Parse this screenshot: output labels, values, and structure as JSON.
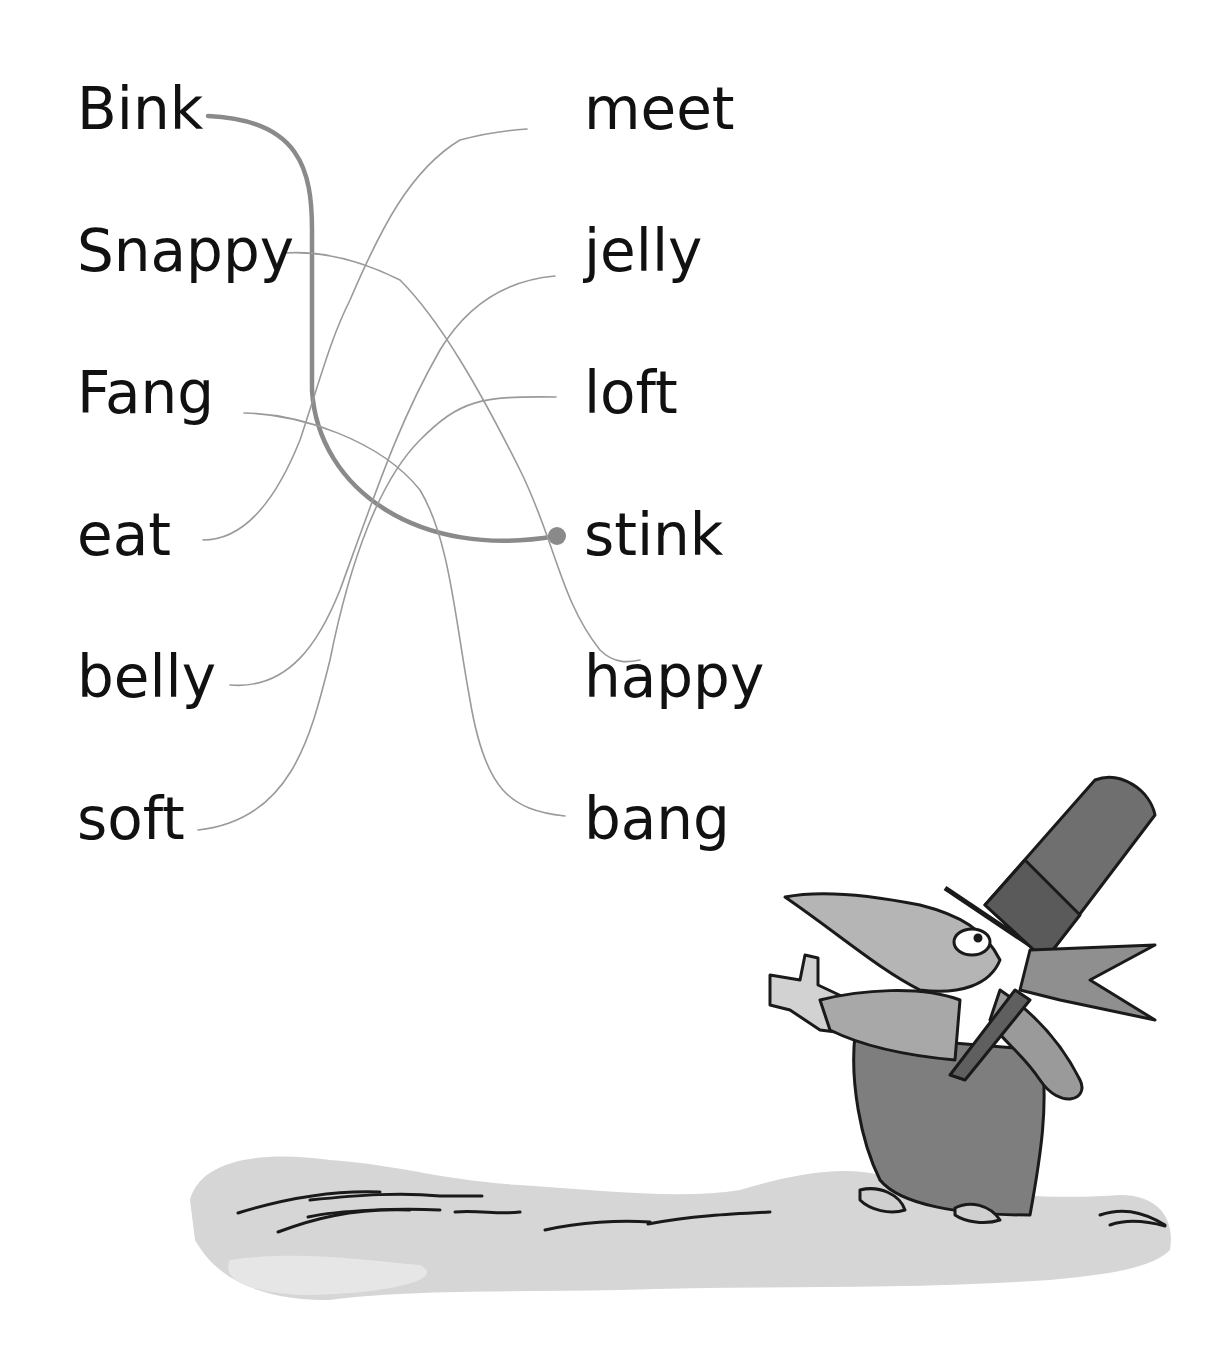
{
  "activity": {
    "type": "word-matching-rhymes",
    "left_words": [
      "Bink",
      "Snappy",
      "Fang",
      "eat",
      "belly",
      "soft"
    ],
    "right_words": [
      "meet",
      "jelly",
      "loft",
      "stink",
      "happy",
      "bang"
    ],
    "connections": [
      {
        "from": "Bink",
        "to": "stink",
        "example": true
      },
      {
        "from": "Snappy",
        "to": "happy",
        "example": false
      },
      {
        "from": "Fang",
        "to": "bang",
        "example": false
      },
      {
        "from": "eat",
        "to": "meet",
        "example": false
      },
      {
        "from": "belly",
        "to": "jelly",
        "example": false
      },
      {
        "from": "soft",
        "to": "loft",
        "example": false
      }
    ]
  },
  "illustration": {
    "subject": "goblin-with-top-hat",
    "ground": "watercolor-ground-wash"
  },
  "colors": {
    "text": "#111111",
    "line": "#9a9a9a",
    "example_line": "#8a8a8a",
    "ink": "#1a1a1a",
    "wash_light": "#cfcfcf",
    "wash_dark": "#777777"
  }
}
